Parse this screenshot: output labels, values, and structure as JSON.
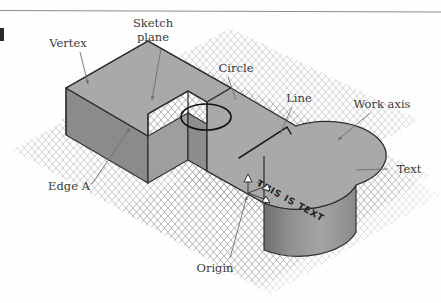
{
  "figure": {
    "background_color": "#fefefe",
    "rule_color": "#8e8e8e",
    "margin_mark": "▌"
  },
  "grid": {
    "name": "isometric-work-plane-grid",
    "color": "#9a9aa2",
    "style": "diamond mesh"
  },
  "solid": {
    "name": "l-shaped-extruded-solid-with-rounded-end",
    "top_face_color": "#a9a9a9",
    "left_face_color": "#8f8f8f",
    "front_face_color": "#9b9b9b",
    "cylinder_face_color": "#8a8a8a",
    "edge_color": "#2f2f2f"
  },
  "inscribed_text": {
    "model_surface_text": "THIS IS TEXT"
  },
  "origin_marker": {
    "name": "origin-axis-triad",
    "axis_labels": [
      "X",
      "Y",
      "Z"
    ]
  },
  "callouts": [
    {
      "id": "sketch-plane",
      "label_line1": "Sketch",
      "label_line2": "plane",
      "label": "Sketch plane",
      "pointer": "arrow",
      "points_to": "top face of solid"
    },
    {
      "id": "vertex",
      "label": "Vertex",
      "pointer": "arrow",
      "points_to": "top-left corner of block"
    },
    {
      "id": "circle",
      "label": "Circle",
      "pointer": "line",
      "points_to": "elliptical circle sketch on top face"
    },
    {
      "id": "line",
      "label": "Line",
      "pointer": "line",
      "points_to": "sketched line on top face"
    },
    {
      "id": "work-axis",
      "label": "Work axis",
      "pointer": "arrow",
      "points_to": "work axis on grid plane"
    },
    {
      "id": "text",
      "label": "Text",
      "pointer": "line",
      "points_to": "text inscribed on model face"
    },
    {
      "id": "edge-a",
      "label": "Edge A",
      "pointer": "arrow",
      "points_to": "vertical edge of left block"
    },
    {
      "id": "origin",
      "label": "Origin",
      "pointer": "arrow",
      "points_to": "origin axis triad on front face"
    }
  ]
}
